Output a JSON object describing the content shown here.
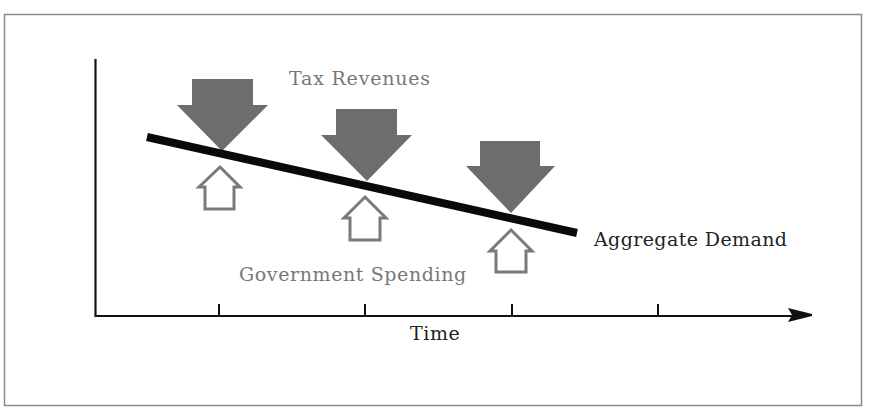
{
  "diagram": {
    "title": "",
    "labels": {
      "tax_revenues": "Tax Revenues",
      "government_spending": "Government Spending",
      "aggregate_demand": "Aggregate Demand",
      "x_axis": "Time"
    },
    "colors": {
      "frame": "#8a8a8a",
      "axis": "#111111",
      "aggregate_demand_line": "#0a0a0a",
      "tax_arrow_fill": "#6d6d6d",
      "spending_arrow_stroke": "#7a7a7a",
      "tax_label": "#777777",
      "spending_label": "#777777",
      "ad_label": "#222222",
      "time_label": "#222222"
    },
    "x_axis_ticks": 4,
    "tax_revenue_arrows": [
      {
        "direction": "down",
        "position": 1
      },
      {
        "direction": "down",
        "position": 2
      },
      {
        "direction": "down",
        "position": 3
      }
    ],
    "government_spending_arrows": [
      {
        "direction": "up",
        "position": 1
      },
      {
        "direction": "up",
        "position": 2
      },
      {
        "direction": "up",
        "position": 3
      }
    ],
    "aggregate_demand_trend": "declining over time"
  }
}
